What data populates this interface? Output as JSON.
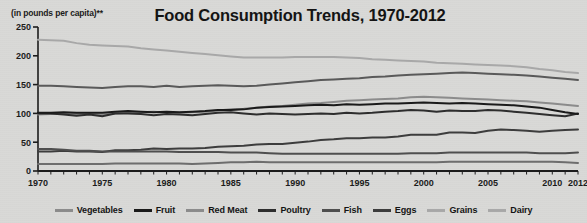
{
  "chart_data": {
    "type": "line",
    "title": "Food Consumption Trends, 1970-2012",
    "ylabel": "(in pounds per capita)**",
    "xlabel": "",
    "xlim": [
      1970,
      2012
    ],
    "ylim": [
      0,
      250
    ],
    "grid": false,
    "legend_position": "bottom",
    "xticks": [
      1970,
      1975,
      1980,
      1985,
      1990,
      1995,
      2000,
      2005,
      2010,
      2012
    ],
    "xtick_labels": [
      "1970",
      "1975",
      "1980",
      "1985",
      "1990",
      "1995",
      "2000",
      "2005",
      "2010",
      "2012"
    ],
    "yticks": [
      0,
      50,
      100,
      150,
      200,
      250
    ],
    "ytick_labels": [
      "0",
      "50",
      "100",
      "150",
      "200",
      "250"
    ],
    "x": [
      1970,
      1971,
      1972,
      1973,
      1974,
      1975,
      1976,
      1977,
      1978,
      1979,
      1980,
      1981,
      1982,
      1983,
      1984,
      1985,
      1986,
      1987,
      1988,
      1989,
      1990,
      1991,
      1992,
      1993,
      1994,
      1995,
      1996,
      1997,
      1998,
      1999,
      2000,
      2001,
      2002,
      2003,
      2004,
      2005,
      2006,
      2007,
      2008,
      2009,
      2010,
      2011,
      2012
    ],
    "series": [
      {
        "name": "Dairy",
        "color": "#a9a9a9",
        "values": [
          228,
          227,
          226,
          222,
          219,
          218,
          217,
          216,
          213,
          211,
          209,
          207,
          205,
          203,
          201,
          199,
          197,
          197,
          197,
          197,
          198,
          198,
          198,
          198,
          197,
          196,
          194,
          193,
          192,
          191,
          190,
          188,
          187,
          186,
          185,
          184,
          183,
          182,
          180,
          177,
          175,
          172,
          170
        ]
      },
      {
        "name": "Grains",
        "color": "#5a5a5a",
        "values": [
          148,
          148,
          147,
          146,
          145,
          144,
          146,
          147,
          147,
          146,
          148,
          146,
          147,
          148,
          149,
          148,
          147,
          148,
          150,
          152,
          154,
          156,
          158,
          159,
          160,
          161,
          163,
          164,
          166,
          167,
          168,
          169,
          170,
          171,
          170,
          169,
          168,
          167,
          166,
          164,
          162,
          160,
          158
        ]
      },
      {
        "name": "Vegetables",
        "color": "#8c8c8c",
        "values": [
          98,
          99,
          100,
          99,
          99,
          98,
          100,
          101,
          102,
          103,
          101,
          101,
          102,
          103,
          105,
          107,
          108,
          110,
          112,
          113,
          115,
          117,
          118,
          120,
          122,
          123,
          124,
          125,
          126,
          128,
          129,
          128,
          127,
          126,
          125,
          124,
          123,
          122,
          121,
          119,
          117,
          115,
          113
        ]
      },
      {
        "name": "Red Meat",
        "color": "#2e2e2e",
        "values": [
          100,
          100,
          98,
          96,
          98,
          95,
          100,
          100,
          99,
          97,
          99,
          98,
          97,
          99,
          101,
          102,
          100,
          98,
          100,
          99,
          98,
          99,
          100,
          99,
          101,
          100,
          101,
          103,
          104,
          106,
          105,
          103,
          105,
          104,
          104,
          106,
          105,
          103,
          101,
          99,
          97,
          95,
          100
        ]
      },
      {
        "name": "Fruit",
        "color": "#1a1a1a",
        "values": [
          101,
          101,
          102,
          101,
          101,
          101,
          103,
          104,
          103,
          102,
          103,
          102,
          103,
          104,
          106,
          106,
          107,
          110,
          111,
          112,
          113,
          114,
          115,
          114,
          116,
          115,
          116,
          117,
          117,
          118,
          119,
          118,
          117,
          118,
          117,
          116,
          115,
          114,
          112,
          110,
          106,
          102,
          99
        ]
      },
      {
        "name": "Poultry",
        "color": "#3d3d3d",
        "values": [
          34,
          34,
          35,
          34,
          34,
          33,
          36,
          36,
          37,
          39,
          38,
          39,
          39,
          40,
          42,
          43,
          44,
          46,
          47,
          47,
          49,
          51,
          54,
          55,
          57,
          57,
          58,
          58,
          60,
          63,
          63,
          63,
          67,
          67,
          66,
          70,
          72,
          71,
          70,
          68,
          70,
          71,
          72
        ]
      },
      {
        "name": "Eggs",
        "color": "#4f4f4f",
        "values": [
          38,
          38,
          37,
          35,
          35,
          34,
          34,
          34,
          34,
          34,
          34,
          33,
          33,
          33,
          33,
          32,
          32,
          32,
          31,
          30,
          30,
          30,
          30,
          30,
          30,
          30,
          30,
          30,
          30,
          31,
          31,
          31,
          32,
          32,
          32,
          32,
          32,
          32,
          32,
          31,
          31,
          31,
          32
        ]
      },
      {
        "name": "Fish",
        "color": "#6e6e6e",
        "values": [
          12,
          12,
          12,
          12,
          12,
          12,
          13,
          13,
          13,
          13,
          13,
          13,
          12,
          13,
          14,
          15,
          15,
          16,
          15,
          15,
          15,
          15,
          15,
          15,
          15,
          15,
          15,
          15,
          15,
          15,
          15,
          15,
          16,
          16,
          16,
          16,
          16,
          16,
          16,
          16,
          16,
          15,
          14
        ]
      }
    ],
    "legend": [
      "Vegetables",
      "Fruit",
      "Red Meat",
      "Poultry",
      "Fish",
      "Eggs",
      "Grains",
      "Dairy"
    ],
    "legend_colors": [
      "#8c8c8c",
      "#1a1a1a",
      "#8c8c8c",
      "#2e2e2e",
      "#4f4f4f",
      "#3d3d3d",
      "#a9a9a9",
      "#a9a9a9"
    ]
  }
}
